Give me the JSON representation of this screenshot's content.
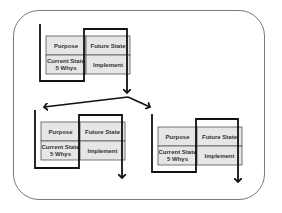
{
  "diagram": {
    "type": "PDCA-style improvement cycle breakdown",
    "colors": {
      "frame_border": "#7a7a7a",
      "cell_fill": "#e6e6e6",
      "cell_border": "#555555",
      "bracket": "#111111",
      "text": "#333333"
    },
    "blocks": [
      {
        "id": "top",
        "cells": {
          "purpose": "Purpose",
          "future_state": "Future State",
          "current_state_line1": "Current State",
          "current_state_line2": "5 Whys",
          "implement": "Implement"
        }
      },
      {
        "id": "bottom-left",
        "cells": {
          "purpose": "Purpose",
          "future_state": "Future State",
          "current_state_line1": "Current State",
          "current_state_line2": "5 Whys",
          "implement": "Implement"
        }
      },
      {
        "id": "bottom-right",
        "cells": {
          "purpose": "Purpose",
          "future_state": "Future State",
          "current_state_line1": "Current State",
          "current_state_line2": "5 Whys",
          "implement": "Implement"
        }
      }
    ],
    "connections": [
      {
        "from": "top",
        "to": "bottom-left",
        "label": ""
      },
      {
        "from": "top",
        "to": "bottom-right",
        "label": ""
      }
    ]
  }
}
